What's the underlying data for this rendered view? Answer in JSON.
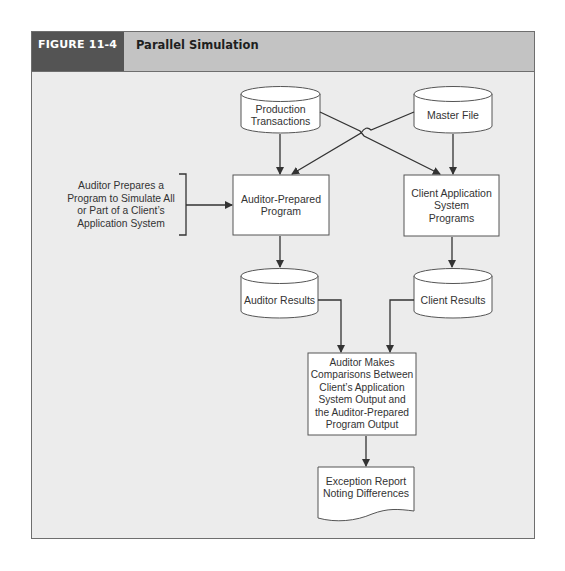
{
  "figure": {
    "label": "FIGURE 11-4",
    "title": "Parallel Simulation"
  },
  "colors": {
    "label_bg": "#545454",
    "header_bg": "#c3c3c3",
    "panel_bg": "#ececec",
    "node_fill": "#ffffff",
    "line": "#333333"
  },
  "nodes": {
    "production_transactions": {
      "type": "cylinder",
      "label": "Production\nTransactions"
    },
    "master_file": {
      "type": "cylinder",
      "label": "Master File"
    },
    "auditor_note": {
      "type": "annotation",
      "label": "Auditor Prepares a\nProgram to Simulate All\nor Part of a Client’s\nApplication System"
    },
    "auditor_program": {
      "type": "process",
      "label": "Auditor-Prepared\nProgram"
    },
    "client_programs": {
      "type": "process",
      "label": "Client Application\nSystem\nPrograms"
    },
    "auditor_results": {
      "type": "cylinder",
      "label": "Auditor Results"
    },
    "client_results": {
      "type": "cylinder",
      "label": "Client Results"
    },
    "comparison": {
      "type": "process",
      "label": "Auditor Makes\nComparisons Between\nClient’s Application\nSystem Output and\nthe Auditor-Prepared\nProgram Output"
    },
    "exception_report": {
      "type": "document",
      "label": "Exception Report\nNoting Differences"
    }
  },
  "edges": [
    {
      "from": "production_transactions",
      "to": "auditor_program"
    },
    {
      "from": "production_transactions",
      "to": "client_programs"
    },
    {
      "from": "master_file",
      "to": "auditor_program"
    },
    {
      "from": "master_file",
      "to": "client_programs"
    },
    {
      "from": "auditor_note",
      "to": "auditor_program"
    },
    {
      "from": "auditor_program",
      "to": "auditor_results"
    },
    {
      "from": "client_programs",
      "to": "client_results"
    },
    {
      "from": "auditor_results",
      "to": "comparison"
    },
    {
      "from": "client_results",
      "to": "comparison"
    },
    {
      "from": "comparison",
      "to": "exception_report"
    }
  ]
}
